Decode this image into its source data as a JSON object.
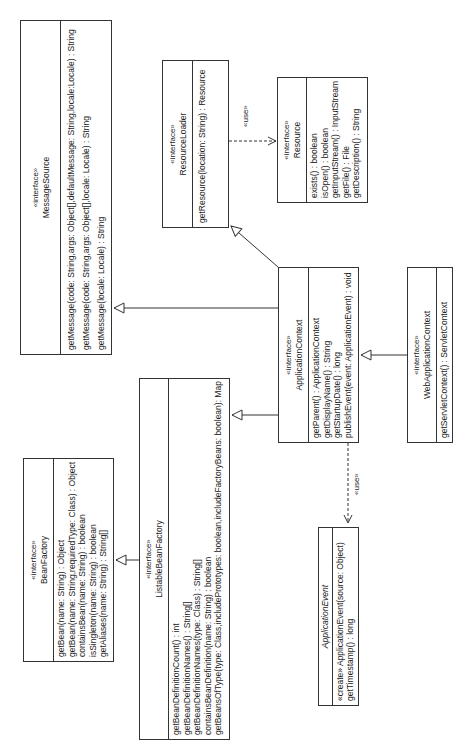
{
  "diagram": {
    "orientation": "rotated 90 degrees counter-clockwise",
    "classes": {
      "message_source": {
        "stereotype": "«interface»",
        "name": "MessageSource",
        "methods": [
          "getMessage(code: String,args: Object[],defaultMessage: String,locale:Locale) : String",
          "getMessage(code: String,args: Object[],locale: Locale) : String",
          "getMessage(locale: Locale) : String"
        ]
      },
      "resource_loader": {
        "stereotype": "«interface»",
        "name": "ResourceLoader",
        "methods": [
          "getResource(location: String) : Resource"
        ]
      },
      "resource": {
        "stereotype": "«interface»",
        "name": "Resource",
        "methods": [
          "exists() : boolean",
          "isOpen() : boolean",
          "getInputStream() : InputStream",
          "getFile() : File",
          "getDescription() : String"
        ]
      },
      "application_context": {
        "stereotype": "«interface»",
        "name": "ApplicationContext",
        "methods": [
          "getParent() : ApplicationContext",
          "getDisplayName() : String",
          "getStartupDate() : long",
          "publishEvent(event: ApplicationEvent) : void"
        ]
      },
      "web_application_context": {
        "stereotype": "«interface»",
        "name": "WebApplicationContext",
        "methods": [
          "getServletContext() : ServletContext"
        ]
      },
      "bean_factory": {
        "stereotype": "«interface»",
        "name": "BeanFactory",
        "methods": [
          "getBean(name: String) : Object",
          "getBean(name: String,requiredType: Class) : Object",
          "containsBean(name: String) : boolean",
          "isSingleton(name: String) : boolean",
          "getAliases(name: String) : String[]"
        ]
      },
      "listable_bean_factory": {
        "stereotype": "«interface»",
        "name": "ListableBeanFactory",
        "methods": [
          "getBeanDefinitionCount() : int",
          "getBeanDefinitionNames() : String[]",
          "getBeanDefinitionNames(type: Class) : String[]",
          "containsBeanDefinition(name: String) : boolean",
          "getBeansOfType(type: Class,includePrototypes: boolean,includeFactoryBeans: boolean): Map"
        ]
      },
      "application_event": {
        "name": "ApplicationEvent",
        "methods": [
          "«create» ApplicationEvent(source: Object)",
          "getTimestamp() : long"
        ]
      }
    },
    "relations": [
      {
        "type": "generalization",
        "from": "ApplicationContext",
        "to": "MessageSource"
      },
      {
        "type": "generalization",
        "from": "ApplicationContext",
        "to": "ResourceLoader"
      },
      {
        "type": "generalization",
        "from": "ApplicationContext",
        "to": "ListableBeanFactory"
      },
      {
        "type": "generalization",
        "from": "WebApplicationContext",
        "to": "ApplicationContext"
      },
      {
        "type": "generalization",
        "from": "ListableBeanFactory",
        "to": "BeanFactory"
      },
      {
        "type": "dependency",
        "from": "ResourceLoader",
        "to": "Resource",
        "label": "«use»"
      },
      {
        "type": "dependency",
        "from": "ApplicationContext",
        "to": "ApplicationEvent",
        "label": "«use»"
      }
    ]
  }
}
